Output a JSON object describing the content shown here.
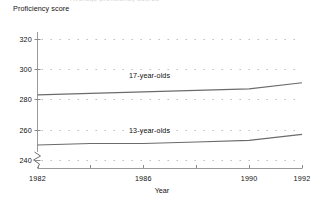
{
  "figure": {
    "cut_off_title": "Average proficiency scores",
    "y_axis_title": "Proficiency score",
    "x_axis_title": "Year",
    "axis_break_symbol": "zigzag-break",
    "line_color": "#6b6b6b",
    "axis_color": "#8a8a8a",
    "grid_color": "#b9b9b9",
    "text_color": "#111111"
  },
  "y_ticks": [
    {
      "value": 320,
      "label": "320"
    },
    {
      "value": 300,
      "label": "300"
    },
    {
      "value": 280,
      "label": "280"
    },
    {
      "value": 260,
      "label": "260"
    },
    {
      "value": 240,
      "label": "240"
    }
  ],
  "x_ticks": [
    {
      "value": 1982,
      "label": "1982"
    },
    {
      "value": 1986,
      "label": "1986"
    },
    {
      "value": 1990,
      "label": "1990"
    },
    {
      "value": 1992,
      "label": "1992"
    }
  ],
  "series_labels": {
    "older": "17-year-olds",
    "younger": "13-year-olds"
  },
  "chart_data": {
    "type": "line",
    "title": "Average proficiency scores",
    "xlabel": "Year",
    "ylabel": "Proficiency score",
    "xlim": [
      1982,
      1992
    ],
    "ylim": [
      235,
      325
    ],
    "yticks": [
      240,
      260,
      280,
      300,
      320
    ],
    "xticks": [
      1982,
      1986,
      1990,
      1992
    ],
    "grid": "dotted-horizontal",
    "y_axis_break": true,
    "legend": "inline-labels",
    "series": [
      {
        "name": "17-year-olds",
        "x": [
          1982,
          1984,
          1986,
          1988,
          1990,
          1992
        ],
        "values": [
          283,
          284,
          285,
          286,
          287,
          291
        ]
      },
      {
        "name": "13-year-olds",
        "x": [
          1982,
          1984,
          1986,
          1988,
          1990,
          1992
        ],
        "values": [
          250,
          251,
          251,
          252,
          253,
          257
        ]
      }
    ]
  }
}
